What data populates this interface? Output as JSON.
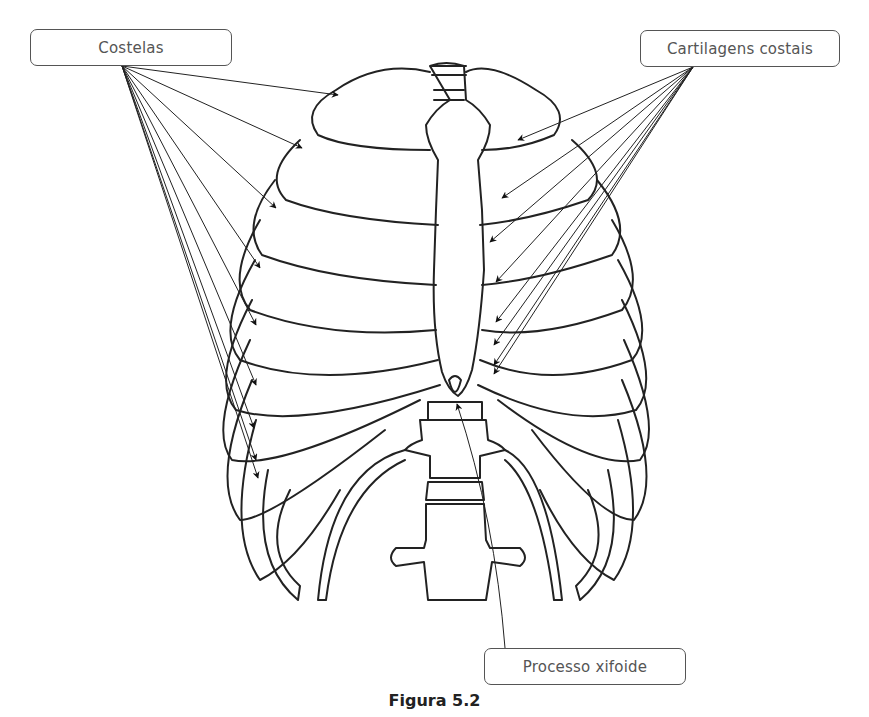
{
  "figure": {
    "caption": "Figura 5.2",
    "labels": [
      {
        "id": "costelas",
        "text": "Costelas",
        "arrow_count": 9
      },
      {
        "id": "cartilagens",
        "text": "Cartilagens costais",
        "arrow_count": 8
      },
      {
        "id": "xifoide",
        "text": "Processo xifoide",
        "arrow_count": 1
      }
    ],
    "colors": {
      "line": "#222222",
      "label_border": "#555555",
      "label_text": "#555555",
      "background": "#ffffff"
    }
  }
}
